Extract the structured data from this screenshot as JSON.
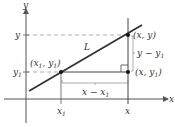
{
  "diagram": {
    "axes": {
      "x_label": "x",
      "y_label": "y"
    },
    "line_label": "L",
    "points": {
      "p1": {
        "label_x": "x",
        "label_sub": "1",
        "label_y": "y",
        "label_ysub": "1"
      },
      "p2": {
        "label": "(x, y)"
      },
      "corner": {
        "label_pre": "(x, y",
        "label_sub": "1",
        "label_post": ")"
      }
    },
    "ticks": {
      "x1": {
        "main": "x",
        "sub": "1"
      },
      "x": "x",
      "y": "y",
      "y1": {
        "main": "y",
        "sub": "1"
      }
    },
    "measures": {
      "run": {
        "main": "x − x",
        "sub": "1"
      },
      "rise": {
        "main": "y − y",
        "sub": "1"
      }
    },
    "colors": {
      "line": "#333333",
      "axis": "#555555",
      "dash": "#999999",
      "point": "#111111"
    }
  }
}
